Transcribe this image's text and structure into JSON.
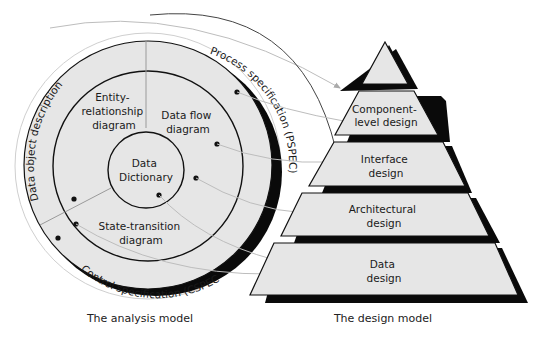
{
  "analysis_model": {
    "caption": "The analysis model",
    "rings": {
      "outer_left": "Data object description",
      "outer_right": "Process specification (PSPEC)",
      "outer_bottom": "Control specification (CSPEC)"
    },
    "quadrants": {
      "top_left": [
        "Entity-",
        "relationship",
        "diagram"
      ],
      "top_right": [
        "Data flow",
        "diagram"
      ],
      "bottom": [
        "State-transition",
        "diagram"
      ]
    },
    "center": [
      "Data",
      "Dictionary"
    ]
  },
  "design_model": {
    "caption": "The design model",
    "layers": [
      {
        "lines": []
      },
      {
        "lines": [
          "Component-",
          "level design"
        ]
      },
      {
        "lines": [
          "Interface",
          "design"
        ]
      },
      {
        "lines": [
          "Architectural",
          "design"
        ]
      },
      {
        "lines": [
          "Data",
          "design"
        ]
      }
    ]
  },
  "colors": {
    "fill": "#e6e6e6",
    "stroke": "#111111",
    "shadow": "#0a0a0a",
    "connector": "#b5b5b5",
    "connector_dark": "#444444"
  }
}
